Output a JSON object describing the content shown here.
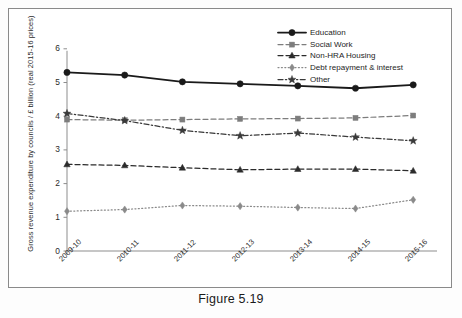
{
  "figure": {
    "caption": "Figure 5.19"
  },
  "chart_data": {
    "type": "line",
    "title": "",
    "xlabel": "",
    "ylabel": "Gross revenue expenditure by councils / £ billion (real 2015-16 prices)",
    "categories": [
      "2009-10",
      "2010-11",
      "2011-12",
      "2012-13",
      "2013-14",
      "2014-15",
      "2015-16"
    ],
    "ylim": [
      0,
      6
    ],
    "yticks": [
      "0",
      "1",
      "2",
      "3",
      "4",
      "5",
      "6"
    ],
    "grid": false,
    "legend_position": "top-right",
    "series": [
      {
        "name": "Education",
        "values": [
          5.3,
          5.22,
          5.02,
          4.96,
          4.9,
          4.83,
          4.93
        ],
        "color": "#1a1a1a",
        "marker": "circle",
        "line_style": "solid"
      },
      {
        "name": "Social Work",
        "values": [
          3.9,
          3.88,
          3.9,
          3.92,
          3.93,
          3.95,
          4.02
        ],
        "color": "#7d7d7d",
        "marker": "square",
        "line_style": "dashed"
      },
      {
        "name": "Non-HRA Housing",
        "values": [
          2.57,
          2.54,
          2.47,
          2.41,
          2.43,
          2.43,
          2.38
        ],
        "color": "#2b2b2b",
        "marker": "triangle",
        "line_style": "dashed"
      },
      {
        "name": "Debt repayment & interest",
        "values": [
          1.18,
          1.23,
          1.35,
          1.33,
          1.29,
          1.26,
          1.52
        ],
        "color": "#8a8a8a",
        "marker": "diamond",
        "line_style": "dotted"
      },
      {
        "name": "Other",
        "values": [
          4.08,
          3.87,
          3.58,
          3.42,
          3.5,
          3.38,
          3.27
        ],
        "color": "#3a3a3a",
        "marker": "star",
        "line_style": "dashdot"
      }
    ]
  }
}
